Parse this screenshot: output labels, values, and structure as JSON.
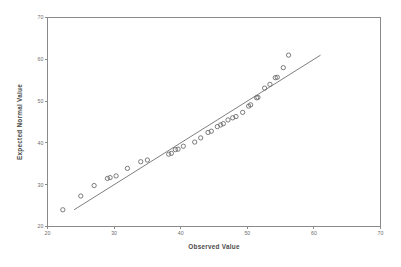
{
  "chart_data": {
    "type": "scatter",
    "title": "",
    "subtitle": "",
    "xlabel": "Observed Value",
    "ylabel": "Expected Normal Value",
    "xlim": [
      20,
      70
    ],
    "ylim": [
      20,
      70
    ],
    "xticks": [
      20,
      30,
      40,
      50,
      60,
      70
    ],
    "yticks": [
      20,
      30,
      40,
      50,
      60,
      70
    ],
    "xtick_labels": [
      "20",
      "30",
      "40",
      "50",
      "60",
      "70"
    ],
    "ytick_labels": [
      "20",
      "30",
      "40",
      "50",
      "60",
      "70"
    ],
    "grid": false,
    "legend": null,
    "legend_position": "none",
    "marker_style": "open-circle",
    "series": [
      {
        "name": "Expected Normal Value vs Observed Value",
        "points": [
          [
            22.3,
            24.0
          ],
          [
            25.0,
            27.3
          ],
          [
            27.0,
            29.8
          ],
          [
            29.0,
            31.5
          ],
          [
            29.4,
            31.7
          ],
          [
            30.3,
            32.1
          ],
          [
            32.0,
            33.9
          ],
          [
            34.0,
            35.5
          ],
          [
            35.0,
            35.9
          ],
          [
            38.2,
            37.3
          ],
          [
            38.6,
            37.5
          ],
          [
            39.2,
            38.4
          ],
          [
            39.6,
            38.5
          ],
          [
            40.4,
            39.2
          ],
          [
            42.1,
            40.2
          ],
          [
            43.0,
            41.2
          ],
          [
            44.1,
            42.5
          ],
          [
            44.6,
            42.8
          ],
          [
            45.5,
            43.9
          ],
          [
            46.0,
            44.3
          ],
          [
            46.4,
            44.6
          ],
          [
            47.1,
            45.5
          ],
          [
            47.8,
            46.0
          ],
          [
            48.3,
            46.3
          ],
          [
            49.3,
            47.3
          ],
          [
            50.2,
            48.8
          ],
          [
            50.5,
            49.1
          ],
          [
            51.4,
            50.8
          ],
          [
            51.6,
            50.9
          ],
          [
            52.6,
            53.1
          ],
          [
            53.4,
            54.0
          ],
          [
            54.2,
            55.6
          ],
          [
            54.5,
            55.7
          ],
          [
            55.4,
            58.0
          ],
          [
            56.2,
            61.0
          ]
        ]
      }
    ],
    "reference_line": {
      "name": "normal-reference-line",
      "from": [
        24.0,
        24.0
      ],
      "to": [
        61.0,
        61.0
      ]
    }
  }
}
